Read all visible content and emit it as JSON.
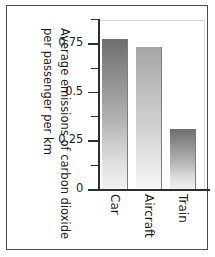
{
  "chart_data": {
    "type": "bar",
    "title": "",
    "categories": [
      "Car",
      "Aircraft",
      "Train"
    ],
    "values": [
      0.77,
      0.73,
      0.31
    ],
    "xlabel": "",
    "ylabel": "Average emissions of carbon dioxide per passenger per km",
    "ylabel_lines": [
      "Average emissions of carbon dioxide",
      "per passenger per km"
    ],
    "ylim": [
      0,
      0.875
    ],
    "ytick_labels": [
      "0",
      "0.25",
      "0.5",
      "0.75"
    ],
    "ytick_values": [
      0,
      0.25,
      0.5,
      0.75
    ],
    "minor_tick_values": [
      0.125,
      0.375,
      0.625,
      0.875
    ],
    "grid": false,
    "legend": "none",
    "orientation": "rotated-90",
    "bar_style": "vertical gradient dark-to-light",
    "colors": {
      "axis": "#2e2e2e",
      "frame": "#4a4a4a",
      "bar_dark_top": "#6e6e6e",
      "bar_light_top": "#a6a6a6",
      "bar_bottom": "#f5f5f5",
      "background": "#ffffff"
    }
  }
}
